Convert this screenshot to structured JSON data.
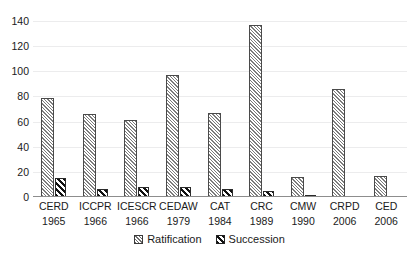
{
  "chart_data": {
    "type": "bar",
    "title": "",
    "xlabel": "",
    "ylabel": "",
    "ylim": [
      0,
      140
    ],
    "yticks": [
      0,
      20,
      40,
      60,
      80,
      100,
      120,
      140
    ],
    "grid": true,
    "legend_position": "bottom-center",
    "categories": [
      "CERD 1965",
      "ICCPR 1966",
      "ICESCR 1966",
      "CEDAW 1979",
      "CAT 1984",
      "CRC 1989",
      "CMW 1990",
      "CRPD 2006",
      "CED 2006"
    ],
    "category_names": [
      "CERD",
      "ICCPR",
      "ICESCR",
      "CEDAW",
      "CAT",
      "CRC",
      "CMW",
      "CRPD",
      "CED"
    ],
    "category_years": [
      "1965",
      "1966",
      "1966",
      "1979",
      "1984",
      "1989",
      "1990",
      "2006",
      "2006"
    ],
    "series": [
      {
        "name": "Ratification",
        "values": [
          79,
          66,
          61,
          97,
          67,
          137,
          16,
          86,
          17
        ]
      },
      {
        "name": "Succession",
        "values": [
          15,
          6,
          8,
          8,
          6,
          5,
          1,
          0,
          0
        ]
      }
    ]
  },
  "legend": {
    "items": [
      {
        "label": "Ratification",
        "pattern": "light-diagonal-hatch"
      },
      {
        "label": "Succession",
        "pattern": "dark-diagonal-stripe"
      }
    ]
  },
  "caption": {
    "text": ""
  }
}
